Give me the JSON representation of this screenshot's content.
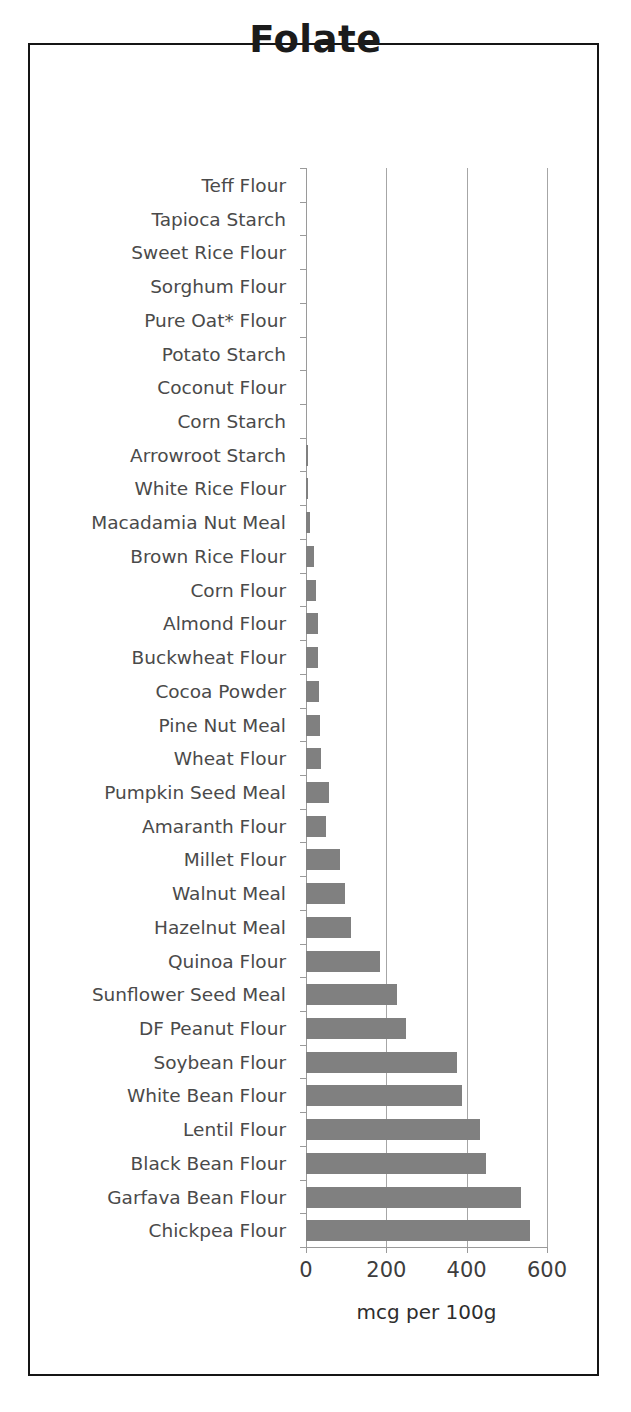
{
  "chart_data": {
    "type": "bar",
    "orientation": "horizontal",
    "title": "Folate",
    "xlabel": "mcg per 100g",
    "ylabel": "",
    "xlim": [
      0,
      600
    ],
    "xticks": [
      0,
      200,
      400,
      600
    ],
    "xtick_labels": [
      "0",
      "200",
      "400",
      "600"
    ],
    "grid": true,
    "grid_axis": "x",
    "legend": false,
    "bar_color": "#808080",
    "categories": [
      "Teff Flour",
      "Tapioca Starch",
      "Sweet Rice Flour",
      "Sorghum Flour",
      "Pure Oat* Flour",
      "Potato Starch",
      "Coconut Flour",
      "Corn Starch",
      "Arrowroot Starch",
      "White Rice Flour",
      "Macadamia Nut Meal",
      "Brown Rice Flour",
      "Corn Flour",
      "Almond Flour",
      "Buckwheat Flour",
      "Cocoa Powder",
      "Pine Nut Meal",
      "Wheat Flour",
      "Pumpkin Seed Meal",
      "Amaranth Flour",
      "Millet Flour",
      "Walnut Meal",
      "Hazelnut Meal",
      "Quinoa Flour",
      "Sunflower Seed Meal",
      "DF Peanut Flour",
      "Soybean Flour",
      "White Bean Flour",
      "Lentil Flour",
      "Black Bean Flour",
      "Garfava Bean Flour",
      "Chickpea Flour"
    ],
    "values": [
      0,
      0,
      0,
      0,
      0,
      0,
      0,
      0,
      5,
      6,
      11,
      20,
      24,
      29,
      30,
      32,
      34,
      37,
      58,
      49,
      85,
      98,
      113,
      184,
      227,
      250,
      375,
      388,
      433,
      448,
      535,
      557
    ]
  },
  "colors": {
    "bar": "#808080",
    "frame": "#151515",
    "grid": "#a6a6a6",
    "label_text": "#4a4a4a",
    "title_text": "#1b1b1b"
  }
}
